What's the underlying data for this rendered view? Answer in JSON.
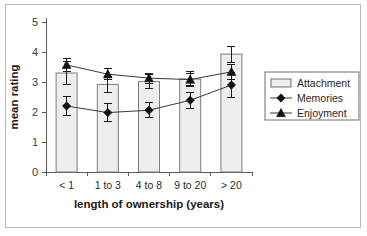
{
  "chart_data": {
    "type": "bar",
    "title": "",
    "subtitle": "",
    "xlabel": "length of ownership (years)",
    "ylabel": "mean rating",
    "categories": [
      "< 1",
      "1 to 3",
      "4 to 8",
      "9 to 20",
      "> 20"
    ],
    "ylim": [
      0,
      5
    ],
    "yticks": [
      0,
      1,
      2,
      3,
      4,
      5
    ],
    "ytick_labels": [
      "0",
      "1",
      "2",
      "3",
      "4",
      "5"
    ],
    "grid": false,
    "legend_position": "right",
    "series": [
      {
        "name": "Attachment",
        "render": "bar",
        "marker": "none",
        "values": [
          3.3,
          2.92,
          3.02,
          3.1,
          3.93
        ],
        "errors": [
          0,
          0,
          0,
          0,
          0
        ]
      },
      {
        "name": "Memories",
        "render": "line",
        "marker": "diamond",
        "values": [
          2.2,
          1.98,
          2.06,
          2.39,
          2.9
        ],
        "errors": [
          0.33,
          0.29,
          0.25,
          0.26,
          0.42
        ]
      },
      {
        "name": "Enjoyment",
        "render": "line",
        "marker": "triangle",
        "values": [
          3.57,
          3.26,
          3.13,
          3.08,
          3.34
        ],
        "errors": [
          0.21,
          0.18,
          0.17,
          0.21,
          0.25
        ]
      }
    ],
    "bar_errors": [
      0.37,
      0.26,
      0.24,
      0.25,
      0.27
    ],
    "colors": {
      "bar_fill": "#eeeeee",
      "bar_stroke": "#7d7d7d",
      "line": "#3a3a3a",
      "marker": "#111111",
      "axis": "#5a5a5a",
      "border": "#b9b9b9",
      "text": "#1f1f1f"
    }
  },
  "legend": {
    "items": [
      {
        "label": "Attachment",
        "icon": "bar-swatch-icon"
      },
      {
        "label": "Memories",
        "icon": "diamond-marker-icon"
      },
      {
        "label": "Enjoyment",
        "icon": "triangle-marker-icon"
      }
    ]
  }
}
